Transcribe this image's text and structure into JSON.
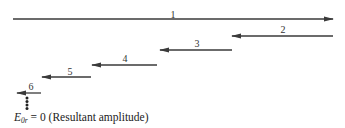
{
  "diagram": {
    "arrow_color": "#3a3a3a",
    "phasors": [
      {
        "label": "1",
        "x1": 13,
        "x2": 333,
        "y": 19,
        "direction": "right",
        "label_x": 173,
        "label_y": 10
      },
      {
        "label": "2",
        "x1": 333,
        "x2": 232,
        "y": 36,
        "direction": "left",
        "label_x": 283,
        "label_y": 25
      },
      {
        "label": "3",
        "x1": 232,
        "x2": 160,
        "y": 50,
        "direction": "left",
        "label_x": 197,
        "label_y": 39
      },
      {
        "label": "4",
        "x1": 157,
        "x2": 92,
        "y": 65,
        "direction": "left",
        "label_x": 125,
        "label_y": 54
      },
      {
        "label": "5",
        "x1": 91,
        "x2": 42,
        "y": 77,
        "direction": "left",
        "label_x": 70,
        "label_y": 67
      },
      {
        "label": "6",
        "x1": 41,
        "x2": 17,
        "y": 93,
        "direction": "left",
        "label_x": 31,
        "label_y": 82
      }
    ],
    "continuation": {
      "symbol": "vertical-dots",
      "x": 27,
      "count": 4
    },
    "caption": {
      "symbol": "E",
      "subscript": "0r",
      "equals": "= 0",
      "description": "(Resultant amplitude)"
    }
  }
}
